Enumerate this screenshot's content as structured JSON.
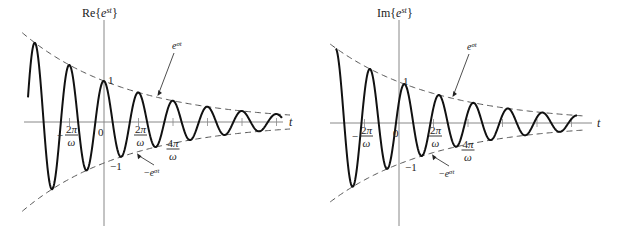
{
  "figure": {
    "panels": [
      {
        "id": "real",
        "title": "Re{e^{st}}",
        "title_main": "Re{",
        "title_base": "e",
        "title_exp": "st",
        "title_close": "}",
        "function": "real",
        "x_axis_label": "t",
        "one_label": "1",
        "neg_one_label": "−1",
        "zero_label": "0",
        "tick_labels": [
          {
            "k": -1,
            "num": "2π",
            "den": "ω",
            "sign": "−"
          },
          {
            "k": 1,
            "num": "2π",
            "den": "ω",
            "sign": ""
          },
          {
            "k": 2,
            "num": "4π",
            "den": "ω",
            "sign": ""
          }
        ],
        "envelope_upper": {
          "base": "e",
          "exp": "σt"
        },
        "envelope_lower": {
          "sign": "−",
          "base": "e",
          "exp": "σt"
        }
      },
      {
        "id": "imag",
        "title": "Im{e^{st}}",
        "title_main": "Im{",
        "title_base": "e",
        "title_exp": "st",
        "title_close": "}",
        "function": "imag",
        "x_axis_label": "t",
        "one_label": "1",
        "neg_one_label": "−1",
        "zero_label": "0",
        "tick_labels": [
          {
            "k": -1,
            "num": "2π",
            "den": "ω",
            "sign": "−"
          },
          {
            "k": 1,
            "num": "2π",
            "den": "ω",
            "sign": ""
          },
          {
            "k": 2,
            "num": "4π",
            "den": "ω",
            "sign": ""
          }
        ],
        "envelope_upper": {
          "base": "e",
          "exp": "σt"
        },
        "envelope_lower": {
          "sign": "−",
          "base": "e",
          "exp": "σt"
        }
      }
    ],
    "signal": {
      "description": "damped sinusoid e^{st}, s = σ + jω, σ < 0",
      "periods_left_of_origin": 2.3,
      "periods_right_of_origin": 5.3,
      "decay_per_period": 0.72
    },
    "colors": {
      "curve": "#111111",
      "envelope": "#555555",
      "axis": "#888888",
      "text": "#222222"
    }
  }
}
